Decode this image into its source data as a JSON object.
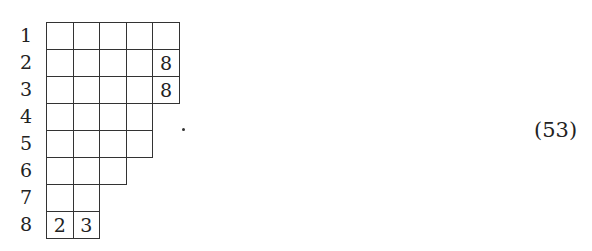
{
  "diagram": {
    "type": "young-tableau",
    "rows": [
      {
        "label": "1",
        "cells": [
          "",
          "",
          "",
          "",
          ""
        ]
      },
      {
        "label": "2",
        "cells": [
          "",
          "",
          "",
          "",
          "8"
        ]
      },
      {
        "label": "3",
        "cells": [
          "",
          "",
          "",
          "",
          "8"
        ]
      },
      {
        "label": "4",
        "cells": [
          "",
          "",
          "",
          ""
        ]
      },
      {
        "label": "5",
        "cells": [
          "",
          "",
          "",
          ""
        ]
      },
      {
        "label": "6",
        "cells": [
          "",
          "",
          ""
        ]
      },
      {
        "label": "7",
        "cells": [
          "",
          ""
        ]
      },
      {
        "label": "8",
        "cells": [
          "2",
          "3"
        ]
      }
    ],
    "trailing_punctuation": "."
  },
  "equation_number": "(53)"
}
